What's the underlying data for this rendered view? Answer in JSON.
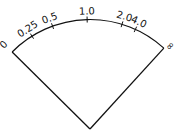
{
  "diagram": {
    "type": "sector-scale",
    "center": {
      "x": 90,
      "y": 129
    },
    "radius": 109.5,
    "start_angle_deg": -45.3,
    "end_angle_deg": 42.4,
    "stroke_color": "#111111",
    "end_labels": {
      "left": {
        "text": "0",
        "x": 6,
        "y": 47,
        "rotate": -45
      },
      "right": {
        "text": "∞",
        "x": 168,
        "y": 44,
        "rotate": 132
      }
    },
    "ticks": [
      {
        "label": "0.25",
        "angle_deg": -32
      },
      {
        "label": "0.5",
        "angle_deg": -20
      },
      {
        "label": "1.0",
        "angle_deg": -1.5
      },
      {
        "label": "2.0",
        "angle_deg": 17
      },
      {
        "label": "4.0",
        "angle_deg": 24.5
      }
    ]
  }
}
